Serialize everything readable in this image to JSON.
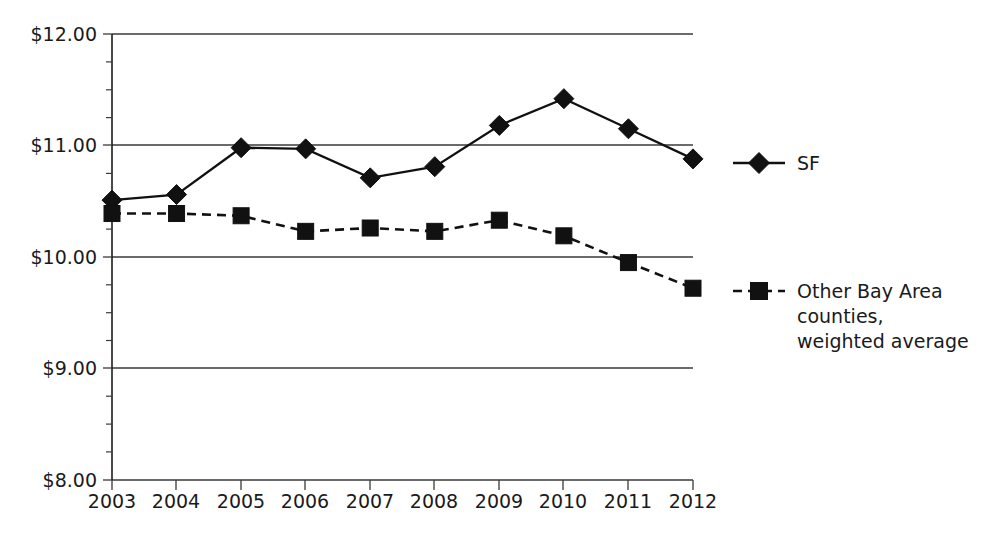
{
  "chart_data": {
    "type": "line",
    "title": "",
    "subtitle": "",
    "xlabel": "",
    "ylabel": "",
    "grid": "horizontal-major-only",
    "legend_position": "right",
    "x": [
      "2003",
      "2004",
      "2005",
      "2006",
      "2007",
      "2008",
      "2009",
      "2010",
      "2011",
      "2012"
    ],
    "categories": [
      "2003",
      "2004",
      "2005",
      "2006",
      "2007",
      "2008",
      "2009",
      "2010",
      "2011",
      "2012"
    ],
    "xtick_labels": [
      "2003",
      "2004",
      "2005",
      "2006",
      "2007",
      "2008",
      "2009",
      "2010",
      "2011",
      "2012"
    ],
    "ytick_labels": [
      "$8.00",
      "$9.00",
      "$10.00",
      "$11.00",
      "$12.00"
    ],
    "ytick_values": [
      8,
      9,
      10,
      11,
      12
    ],
    "yminor_step": 0.25,
    "ylim": [
      8,
      12
    ],
    "series": [
      {
        "name": "SF",
        "marker": "diamond",
        "linestyle": "solid",
        "color": "#111111",
        "values": [
          10.51,
          10.56,
          10.98,
          10.97,
          10.71,
          10.81,
          11.18,
          11.42,
          11.15,
          10.88
        ]
      },
      {
        "name": "Other Bay Area counties, weighted average",
        "marker": "square",
        "linestyle": "dashed",
        "color": "#111111",
        "values": [
          10.39,
          10.39,
          10.37,
          10.23,
          10.26,
          10.23,
          10.33,
          10.19,
          9.95,
          9.72
        ]
      }
    ]
  },
  "legend": {
    "entries": [
      {
        "label_lines": [
          "SF"
        ],
        "marker": "diamond-marker",
        "linestyle": "solid"
      },
      {
        "label_lines": [
          "Other Bay Area",
          "counties,",
          "weighted average"
        ],
        "marker": "square-marker",
        "linestyle": "dashed"
      }
    ],
    "entry_0_line_0": "SF",
    "entry_1_line_0": "Other Bay Area",
    "entry_1_line_1": "counties,",
    "entry_1_line_2": "weighted average"
  },
  "axes": {
    "y_labels": {
      "t12": "$12.00",
      "t11": "$11.00",
      "t10": "$10.00",
      "t9": "$9.00",
      "t8": "$8.00"
    },
    "x_labels": {
      "y0": "2003",
      "y1": "2004",
      "y2": "2005",
      "y3": "2006",
      "y4": "2007",
      "y5": "2008",
      "y6": "2009",
      "y7": "2010",
      "y8": "2011",
      "y9": "2012"
    }
  },
  "colors": {
    "background": "#ffffff",
    "ink": "#111111",
    "axis": "#3a3a3a"
  }
}
